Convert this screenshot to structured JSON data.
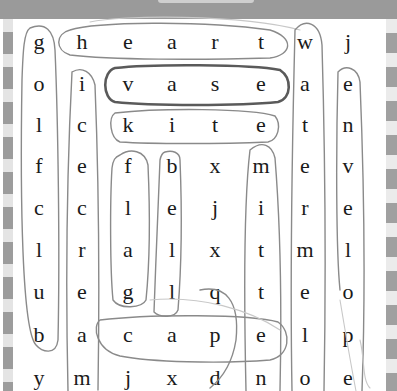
{
  "puzzle": {
    "type": "word-search",
    "rows": 9,
    "cols": 8,
    "grid": [
      [
        "g",
        "h",
        "e",
        "a",
        "r",
        "t",
        "w",
        "j"
      ],
      [
        "o",
        "i",
        "v",
        "a",
        "s",
        "e",
        "a",
        "e"
      ],
      [
        "l",
        "c",
        "k",
        "i",
        "t",
        "e",
        "t",
        "n"
      ],
      [
        "f",
        "e",
        "f",
        "b",
        "x",
        "m",
        "e",
        "v"
      ],
      [
        "c",
        "c",
        "l",
        "e",
        "j",
        "i",
        "r",
        "e"
      ],
      [
        "l",
        "r",
        "a",
        "l",
        "x",
        "t",
        "m",
        "l"
      ],
      [
        "u",
        "e",
        "g",
        "l",
        "q",
        "t",
        "e",
        "o"
      ],
      [
        "b",
        "a",
        "c",
        "a",
        "p",
        "e",
        "l",
        "p"
      ],
      [
        "y",
        "m",
        "j",
        "x",
        "d",
        "n",
        "o",
        "e"
      ]
    ],
    "found_words": [
      "heart",
      "vase",
      "kite",
      "golfclub",
      "icecream",
      "flag",
      "bell",
      "mitten",
      "cape",
      "water",
      "melon",
      "envelope"
    ]
  },
  "layout": {
    "col_x": [
      39,
      82,
      128,
      172,
      215,
      261,
      305,
      348
    ],
    "row_y": [
      44,
      86,
      127,
      168,
      210,
      252,
      294,
      337,
      380
    ]
  },
  "colors": {
    "topbar": "#9a9a9a",
    "stripe_dark": "#9c9c9c",
    "stripe_light": "#e4e4e4",
    "letter": "#1a1a1a",
    "pencil": "#8a8a8a",
    "pencil_bold": "#5a5a5a"
  }
}
